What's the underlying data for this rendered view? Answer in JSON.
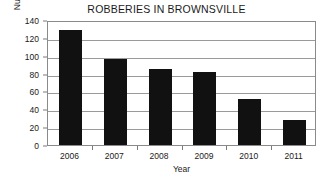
{
  "chart_data": {
    "type": "bar",
    "title": "ROBBERIES IN BROWNSVILLE",
    "xlabel": "Year",
    "ylabel": "Number of robberies",
    "categories": [
      "2006",
      "2007",
      "2008",
      "2009",
      "2010",
      "2011"
    ],
    "values": [
      129,
      96,
      85,
      82,
      51,
      28
    ],
    "ylim": [
      0,
      140
    ],
    "ytick_step": 20,
    "yticks": [
      "0",
      "20",
      "40",
      "60",
      "80",
      "100",
      "120",
      "140"
    ],
    "grid": true,
    "legend": false,
    "legend_position": "none",
    "bar_color": "#111111",
    "grid_color": "#9a9a9a",
    "frame_color": "#8a8a8a",
    "background_color": "#ffffff",
    "text_color": "#1a1a1a"
  }
}
